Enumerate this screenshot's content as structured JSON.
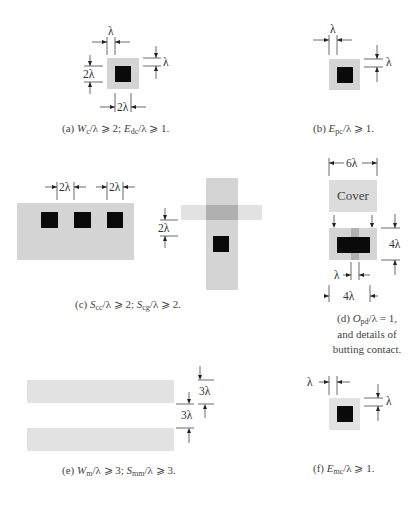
{
  "figure": {
    "panels": {
      "a": {
        "labels": {
          "top": "λ",
          "right": "λ",
          "left": "2λ",
          "bottom": "2λ"
        },
        "caption": {
          "prefix": "(a) ",
          "t1_main": "W",
          "t1_sub": "c",
          "t1_rest": "/λ ⩾ 2;  ",
          "t2_main": "E",
          "t2_sub": "dc",
          "t2_rest": "/λ ⩾ 1."
        }
      },
      "b": {
        "labels": {
          "top": "λ",
          "right": "λ"
        },
        "caption": {
          "prefix": "(b) ",
          "t1_main": "E",
          "t1_sub": "pc",
          "t1_rest": "/λ ⩾ 1."
        }
      },
      "c": {
        "labels": {
          "spacing1": "2λ",
          "spacing2": "2λ",
          "cross_left": "2λ"
        },
        "caption": {
          "prefix": "(c) ",
          "t1_main": "S",
          "t1_sub": "cc",
          "t1_rest": "/λ ⩾ 2;  ",
          "t2_main": "S",
          "t2_sub": "cg",
          "t2_rest": "/λ ⩾ 2."
        }
      },
      "d": {
        "labels": {
          "width": "6λ",
          "cover": "Cover",
          "height": "4λ",
          "stripe": "λ",
          "bottom": "4λ"
        },
        "caption": {
          "prefix": "(d) ",
          "t1_main": "O",
          "t1_sub": "pd",
          "t1_rest": "/λ = 1,",
          "line2": "and details of",
          "line3": "butting contact."
        }
      },
      "e": {
        "labels": {
          "width": "3λ",
          "spacing": "3λ"
        },
        "caption": {
          "prefix": "(e) ",
          "t1_main": "W",
          "t1_sub": "m",
          "t1_rest": "/λ ⩾ 3;  ",
          "t2_main": "S",
          "t2_sub": "mm",
          "t2_rest": "/λ ⩾ 3."
        }
      },
      "f": {
        "labels": {
          "left": "λ",
          "right": "λ"
        },
        "caption": {
          "prefix": "(f) ",
          "t1_main": "E",
          "t1_sub": "mc",
          "t1_rest": "/λ ⩾ 1."
        }
      }
    }
  }
}
